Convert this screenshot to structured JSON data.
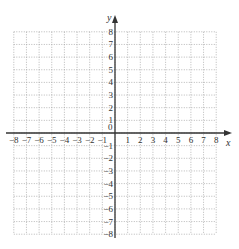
{
  "diagram": {
    "type": "coordinate-plane",
    "x_axis": {
      "label": "x",
      "min": -8,
      "max": 8,
      "step": 1
    },
    "y_axis": {
      "label": "y",
      "min": -8,
      "max": 8,
      "step": 1
    },
    "origin_label": "0",
    "x_tick_labels": [
      "-8",
      "-7",
      "-6",
      "-5",
      "-4",
      "-3",
      "-2",
      "-1",
      "1",
      "2",
      "3",
      "4",
      "5",
      "6",
      "7",
      "8"
    ],
    "y_tick_labels": [
      "8",
      "7",
      "6",
      "5",
      "4",
      "3",
      "2",
      "1",
      "-1",
      "-2",
      "-3",
      "-4",
      "-5",
      "-6",
      "-7",
      "-8"
    ],
    "grid": {
      "style": "dotted",
      "color": "#9a9a9a"
    },
    "axis_color": "#333333"
  }
}
